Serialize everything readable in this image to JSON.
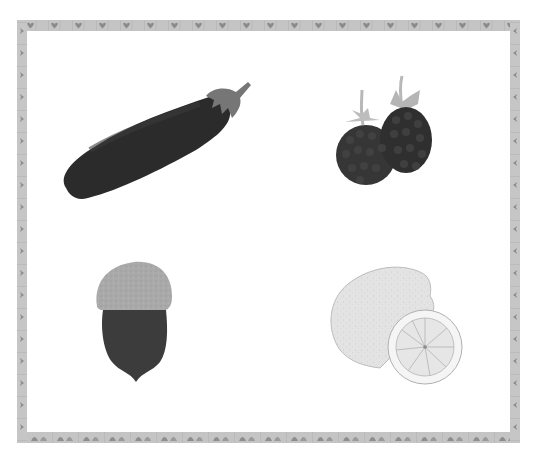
{
  "image": {
    "description": "Grayscale illustration card with a decorative tiled border showing four produce items",
    "border": {
      "pattern_top": "heart-tiles",
      "pattern_bottom": "arch-tiles",
      "pattern_sides": "chevron-tiles",
      "color": "#bdbdbd",
      "tile_color": "#9a9a9a"
    },
    "background": "#ffffff"
  },
  "items": [
    {
      "name": "eggplant",
      "label": "Eggplant",
      "color": "#2a2a2a",
      "stem_color": "#7a7a7a"
    },
    {
      "name": "blackberries",
      "label": "Blackberries",
      "color": "#333333",
      "leaf_color": "#b5b5b5"
    },
    {
      "name": "acorn",
      "label": "Acorn",
      "cap_color": "#a8a8a8",
      "nut_color": "#3c3c3c"
    },
    {
      "name": "lemon",
      "label": "Lemon",
      "color": "#e2e2e2",
      "slice_color": "#eaeaea"
    }
  ]
}
